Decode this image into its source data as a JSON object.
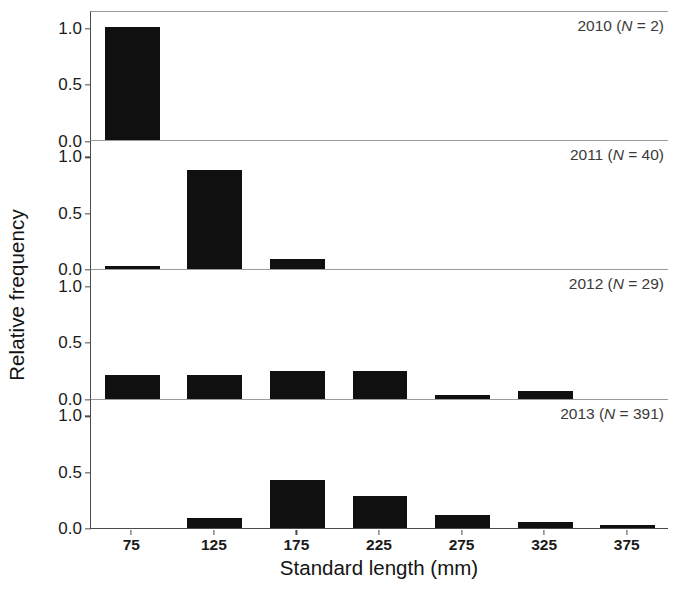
{
  "chart_data": {
    "type": "bar",
    "title": "",
    "subtitle": "",
    "xlabel": "Standard length (mm)",
    "ylabel": "Relative frequency",
    "categories": [
      75,
      125,
      175,
      225,
      275,
      325,
      375
    ],
    "tick_labels": [
      "75",
      "125",
      "175",
      "225",
      "275",
      "325",
      "375"
    ],
    "ytick_labels": [
      "0.0",
      "0.5",
      "1.0"
    ],
    "ytick_values": [
      0.0,
      0.5,
      1.0
    ],
    "ylim": [
      0,
      1.15
    ],
    "grid": false,
    "legend": "none",
    "layout": "4 stacked panels, shared x axis",
    "bar_color": "#101010",
    "axis_color": "#4a4a4a",
    "panels": [
      {
        "label": "2010 (N = 2)",
        "year": "2010",
        "n_prefix": "N",
        "n_value": "2",
        "values": [
          1.0,
          0,
          0,
          0,
          0,
          0,
          0
        ]
      },
      {
        "label": "2011 (N = 40)",
        "year": "2011",
        "n_prefix": "N",
        "n_value": "40",
        "values": [
          0.025,
          0.88,
          0.09,
          0,
          0,
          0,
          0
        ]
      },
      {
        "label": "2012 (N = 29)",
        "year": "2012",
        "n_prefix": "N",
        "n_value": "29",
        "values": [
          0.21,
          0.21,
          0.24,
          0.24,
          0.03,
          0.07,
          0
        ]
      },
      {
        "label": "2013 (N = 391)",
        "year": "2013",
        "n_prefix": "N",
        "n_value": "391",
        "values": [
          0,
          0.09,
          0.43,
          0.28,
          0.12,
          0.05,
          0.02
        ]
      }
    ]
  }
}
